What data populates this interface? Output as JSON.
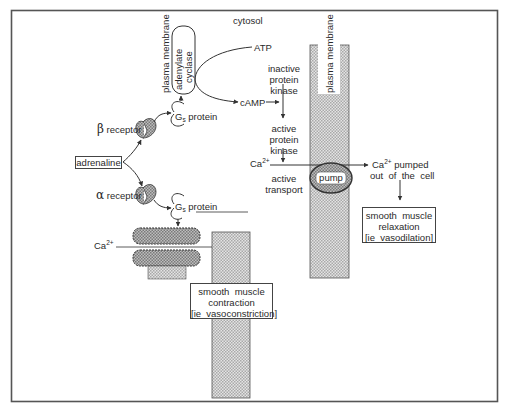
{
  "diagram": {
    "labels": {
      "cytosol": "cytosol",
      "plasma_membrane_left": "plasma  membrane",
      "plasma_membrane_right": "plasma  membrane",
      "adenylate_cyclase_line1": "adenylate",
      "adenylate_cyclase_line2": "cyclase",
      "atp": "ATP",
      "camp": "cAMP",
      "beta_symbol": "β",
      "beta_receptor": "receptor",
      "alpha_symbol": "α",
      "alpha_receptor": "receptor",
      "g_protein_top_g": "G",
      "g_protein_top_sub": "s",
      "g_protein_top_text": "protein",
      "g_protein_bottom_g": "G",
      "g_protein_bottom_sub": "s",
      "g_protein_bottom_text": "protein",
      "adrenaline": "adrenaline",
      "inactive_kinase_1": "inactive",
      "inactive_kinase_2": "protein",
      "inactive_kinase_3": "kinase",
      "active_kinase_1": "active",
      "active_kinase_2": "protein",
      "active_kinase_3": "kinase",
      "ca_left": "Ca",
      "ca_left_sup": "2+",
      "ca_right": "Ca",
      "ca_right_sup": "2+",
      "ca_channel": "Ca",
      "ca_channel_sup": "2+",
      "active_transport_1": "active",
      "active_transport_2": "transport",
      "pump": "pump",
      "pumped_1_suffix": " pumped",
      "pumped_2": "out  of  the  cell",
      "relaxation_1": "smooth  muscle",
      "relaxation_2": "relaxation",
      "relaxation_3": "[ie  vasodilation]",
      "contraction_1": "smooth  muscle",
      "contraction_2": "contraction",
      "contraction_3": "[ie  vasoconstriction]"
    },
    "colors": {
      "frame": "#555555",
      "line": "#333333",
      "membrane_fill": "#cfcfcf",
      "receptor_fill": "#9a9a9a",
      "channel_fill": "#a8a8a8"
    }
  }
}
